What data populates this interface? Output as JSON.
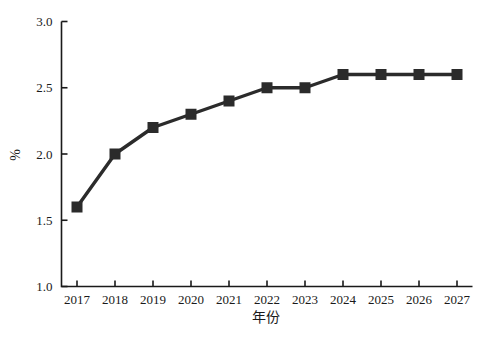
{
  "chart_data": {
    "type": "line",
    "title": "",
    "xlabel": "年份",
    "ylabel": "%",
    "categories": [
      "2017",
      "2018",
      "2019",
      "2020",
      "2021",
      "2022",
      "2023",
      "2024",
      "2025",
      "2026",
      "2027"
    ],
    "x": [
      2017,
      2018,
      2019,
      2020,
      2021,
      2022,
      2023,
      2024,
      2025,
      2026,
      2027
    ],
    "values": [
      1.6,
      2.0,
      2.2,
      2.3,
      2.4,
      2.5,
      2.5,
      2.6,
      2.6,
      2.6,
      2.6
    ],
    "series": [
      {
        "name": "",
        "values": [
          1.6,
          2.0,
          2.2,
          2.3,
          2.4,
          2.5,
          2.5,
          2.6,
          2.6,
          2.6,
          2.6
        ]
      }
    ],
    "ylim": [
      1.0,
      3.0
    ],
    "yticks": [
      1.0,
      1.5,
      2.0,
      2.5,
      3.0
    ],
    "ytick_labels": [
      "1.0",
      "1.5",
      "2.0",
      "2.5",
      "3.0"
    ],
    "xtick_labels": [
      "2017",
      "2018",
      "2019",
      "2020",
      "2021",
      "2022",
      "2023",
      "2024",
      "2025",
      "2026",
      "2027"
    ],
    "grid": false,
    "legend": false,
    "legend_position": "none",
    "marker": "square",
    "line_color": "#2b2b2b",
    "marker_color": "#2b2b2b",
    "background_color": "#ffffff",
    "axis_color": "#1a1a1a"
  }
}
